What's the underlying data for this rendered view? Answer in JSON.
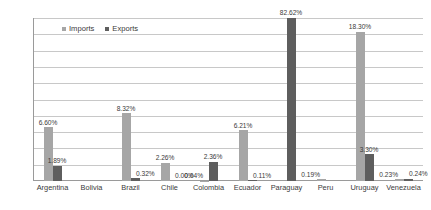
{
  "chart_data": {
    "type": "bar",
    "title": "",
    "xlabel": "",
    "ylabel": "",
    "ylim": [
      0,
      20
    ],
    "yticks": [
      "0%",
      "2%",
      "4%",
      "6%",
      "8%",
      "10%",
      "12%",
      "14%",
      "16%",
      "18%",
      "20%"
    ],
    "ytick_values": [
      0,
      2,
      4,
      6,
      8,
      10,
      12,
      14,
      16,
      18,
      20
    ],
    "grid": true,
    "legend_position": "top-left-inside",
    "categories": [
      "Argentina",
      "Bolivia",
      "Brazil",
      "Chile",
      "Colombia",
      "Ecuador",
      "Paraguay",
      "Peru",
      "Uruguay",
      "Venezuela"
    ],
    "series": [
      {
        "name": "Imports",
        "color": "#a6a6a6",
        "values": [
          6.6,
          null,
          8.32,
          2.26,
          0.04,
          6.21,
          null,
          0.19,
          18.3,
          0.23
        ],
        "labels": [
          "6.60%",
          "",
          "8.32%",
          "2.26%",
          "0.04%",
          "6.21%",
          "",
          "0.19%",
          "18.30%",
          "0.23%"
        ]
      },
      {
        "name": "Exports",
        "color": "#5e5e5e",
        "values": [
          1.89,
          null,
          0.32,
          0.0,
          2.36,
          0.11,
          82.62,
          null,
          3.3,
          0.24
        ],
        "labels": [
          "1.89%",
          "",
          "0.32%",
          "0.00%",
          "2.36%",
          "0.11%",
          "82.62%",
          "",
          "3.30%",
          "0.24%"
        ]
      }
    ]
  },
  "legend": {
    "items": [
      {
        "label": "Imports",
        "swatch": "imports"
      },
      {
        "label": "Exports",
        "swatch": "exports"
      }
    ]
  }
}
